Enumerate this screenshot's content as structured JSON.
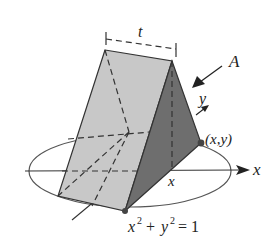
{
  "figure": {
    "type": "3D solid cross-section diagram",
    "labels": {
      "thickness": "t",
      "cross_section": "A",
      "y_axis": "y",
      "x_axis": "x",
      "x_position": "x",
      "point": "(x,y)",
      "circle_eq_lhs_x": "x",
      "circle_eq_lhs_y": "y",
      "exp": "2",
      "plus": "+",
      "equals": "= 1"
    },
    "colors": {
      "left_face": "#c8c8c8",
      "right_face": "#6e6e6e",
      "edge": "#333333",
      "ellipse": "#555555",
      "dot": "#444444"
    }
  }
}
